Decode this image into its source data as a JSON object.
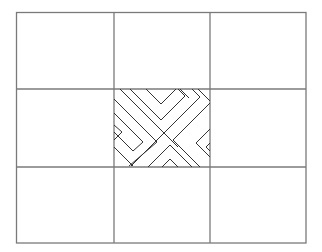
{
  "diagram": {
    "title": "",
    "grid": {
      "rows": 3,
      "cols": 3,
      "left": 16,
      "top": 12,
      "right": 306,
      "bottom": 243,
      "col_lines": [
        114,
        210
      ],
      "row_lines": [
        89,
        167
      ],
      "line_color": "#7a7a7a"
    },
    "pattern": {
      "cell": "row 2, col 2",
      "style": "nested chevrons forming an X",
      "line_color": "#333333"
    }
  }
}
